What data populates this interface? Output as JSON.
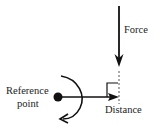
{
  "diagram": {
    "labels": {
      "force": "Force",
      "reference_line1": "Reference",
      "reference_line2": "point",
      "distance": "Distance"
    },
    "colors": {
      "stroke": "#111111",
      "text": "#222222",
      "background": "#ffffff"
    }
  }
}
